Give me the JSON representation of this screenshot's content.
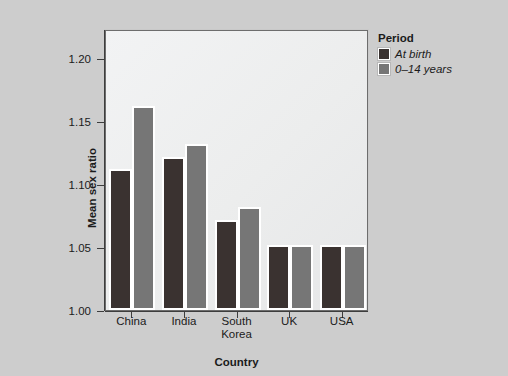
{
  "chart_data": {
    "type": "bar",
    "title": "",
    "xlabel": "Country",
    "ylabel": "Mean sex ratio",
    "categories": [
      "China",
      "India",
      "South\nKorea",
      "UK",
      "USA"
    ],
    "series": [
      {
        "name": "At birth",
        "values": [
          1.11,
          1.12,
          1.07,
          1.05,
          1.05
        ],
        "color": "#3a3230"
      },
      {
        "name": "0–14 years",
        "values": [
          1.16,
          1.13,
          1.08,
          1.05,
          1.05
        ],
        "color": "#767676"
      }
    ],
    "ylim": [
      1.0,
      1.223
    ],
    "yticks": [
      1.0,
      1.05,
      1.1,
      1.15,
      1.2
    ],
    "ytick_labels": [
      "1.00",
      "1.05",
      "1.10",
      "1.15",
      "1.20"
    ],
    "grid": false,
    "legend_position": "top-right-outside"
  },
  "legend": {
    "title": "Period",
    "entries": [
      {
        "label": "At birth",
        "swatch": "#3a3230"
      },
      {
        "label": "0–14 years",
        "swatch": "#767676"
      }
    ]
  },
  "axes": {
    "y_title": "Mean sex ratio",
    "x_title": "Country"
  },
  "caption": {
    "text": ""
  },
  "colors": {
    "page_background": "#cdcdcd",
    "plot_background": "#eceded",
    "axis": "#3d3d3d",
    "series_at_birth": "#3a3230",
    "series_0_14": "#767676",
    "bar_outline": "#ffffff"
  }
}
